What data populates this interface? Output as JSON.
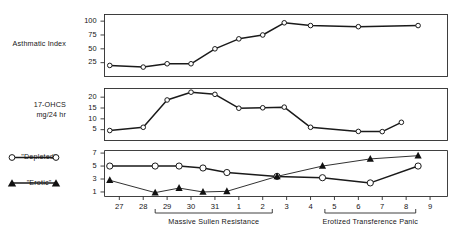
{
  "chart_data": {
    "type": "line",
    "title": "",
    "subtitle": "",
    "xlabel": "",
    "grid": false,
    "legend_position": "left",
    "x": [
      26.6,
      27,
      28,
      28.5,
      29,
      29.5,
      30,
      30.5,
      31,
      31.5,
      1,
      2,
      2.6,
      3,
      4,
      4.5,
      5,
      6,
      6.5,
      7,
      7.8,
      8.5
    ],
    "x_tick_labels": [
      "27",
      "28",
      "29",
      "30",
      "31",
      "1",
      "2",
      "3",
      "4",
      "5",
      "6",
      "7",
      "8",
      "9"
    ],
    "panels": [
      {
        "id": "asthmatic-index",
        "ylabel": "Asthmatic Index",
        "ylabel_line1": "Asthmatic Index",
        "ylabel_line2": "",
        "ylim": [
          0,
          112
        ],
        "yticks": [
          25,
          50,
          75,
          100
        ],
        "ytick_labels": [
          "25",
          "50",
          "75",
          "100"
        ],
        "series": [
          {
            "name": "Asthmatic Index",
            "marker": "open-circle",
            "x": [
              26.6,
              28,
              29,
              30,
              31,
              1,
              2,
              2.9,
              4,
              6,
              8.5
            ],
            "values": [
              20,
              17,
              23,
              23,
              50,
              68,
              75,
              97,
              92,
              90,
              92
            ]
          }
        ]
      },
      {
        "id": "ohcs",
        "ylabel": "17-OHCS mg/24 hr",
        "ylabel_line1": "17-OHCS",
        "ylabel_line2": "mg/24 hr",
        "ylim": [
          0,
          24
        ],
        "yticks": [
          5,
          10,
          15,
          20
        ],
        "ytick_labels": [
          "5",
          "10",
          "15",
          "20"
        ],
        "series": [
          {
            "name": "17-OHCS",
            "marker": "open-circle",
            "x": [
              26.6,
              28,
              29,
              30,
              31,
              1,
              2,
              2.9,
              4,
              6,
              7,
              7.8
            ],
            "values": [
              4.6,
              6.1,
              18.7,
              22.3,
              21.3,
              14.9,
              15.1,
              15.4,
              6.1,
              4.2,
              4.1,
              8.4
            ]
          }
        ]
      },
      {
        "id": "affect-ratings",
        "ylabel": "",
        "ylabel_line1": "",
        "ylabel_line2": "",
        "ylim": [
          0.3,
          7.4
        ],
        "yticks": [
          1,
          3,
          5,
          7
        ],
        "ytick_labels": [
          "1",
          "3",
          "5",
          "7"
        ],
        "series": [
          {
            "name": "\"Depleted\"",
            "marker": "open-circle",
            "x": [
              26.6,
              28.5,
              29.5,
              30.5,
              31.5,
              2.6,
              4.5,
              6.5,
              8.5
            ],
            "values": [
              5.0,
              5.0,
              5.0,
              4.7,
              4.0,
              3.4,
              3.2,
              2.4,
              5.0
            ]
          },
          {
            "name": "\"Erotic\"",
            "marker": "filled-triangle",
            "x": [
              26.6,
              28.5,
              29.5,
              30.5,
              31.5,
              2.6,
              4.5,
              6.5,
              8.5
            ],
            "values": [
              2.8,
              0.9,
              1.6,
              1.0,
              1.1,
              3.4,
              5.0,
              6.1,
              6.6
            ]
          }
        ]
      }
    ],
    "annotations": [
      {
        "id": "bracket-left",
        "label": "Massive Sullen Resistance",
        "x_start": 28.5,
        "x_end": 2.4
      },
      {
        "id": "bracket-right",
        "label": "Erotized Transference Panic",
        "x_start": 4.6,
        "x_end": 8.4
      }
    ],
    "legend": [
      {
        "label": "\"Depleted\"",
        "marker": "open-circle"
      },
      {
        "label": "\"Erotic\"",
        "marker": "filled-triangle"
      }
    ]
  },
  "colors": {
    "ink": "#1a1a1a",
    "axis": "#2b2b2b",
    "background": "#ffffff",
    "marker_fill": "#ffffff"
  }
}
